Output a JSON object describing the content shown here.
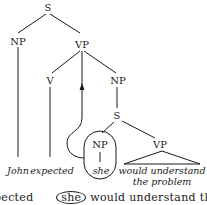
{
  "tree": {
    "root": "S",
    "nodes": {
      "s_top": "S",
      "np_subject": "NP",
      "vp_main": "VP",
      "v": "V",
      "np_object": "NP",
      "s_embedded": "S",
      "np_embedded": "NP",
      "vp_embedded": "VP"
    },
    "leaves": {
      "john": "John",
      "expected": "expected",
      "she": "she",
      "vp_line1": "would understand",
      "vp_line2": "the problem"
    }
  },
  "caption": {
    "before": "pected",
    "circled": "she",
    "after": "would understand th"
  },
  "colors": {
    "ink": "#1a1a1a",
    "background": "#ffffff"
  }
}
